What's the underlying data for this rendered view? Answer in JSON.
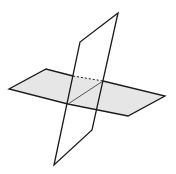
{
  "diagram": {
    "colors": {
      "stroke": "#1a1a1a",
      "horizontal_fill": "#e6e6e6",
      "background": "#ffffff"
    },
    "horizontal_plane": {
      "points": "9,89 46,69 165,96 128,116"
    },
    "vertical_plane": {
      "points": "118,13 80,42 54,165 92,130"
    },
    "hidden_edge": {
      "x1": 73,
      "y1": 76,
      "x2": 103,
      "y2": 81
    },
    "intersection_line": {
      "x1": 68,
      "y1": 104,
      "x2": 103,
      "y2": 81
    }
  }
}
